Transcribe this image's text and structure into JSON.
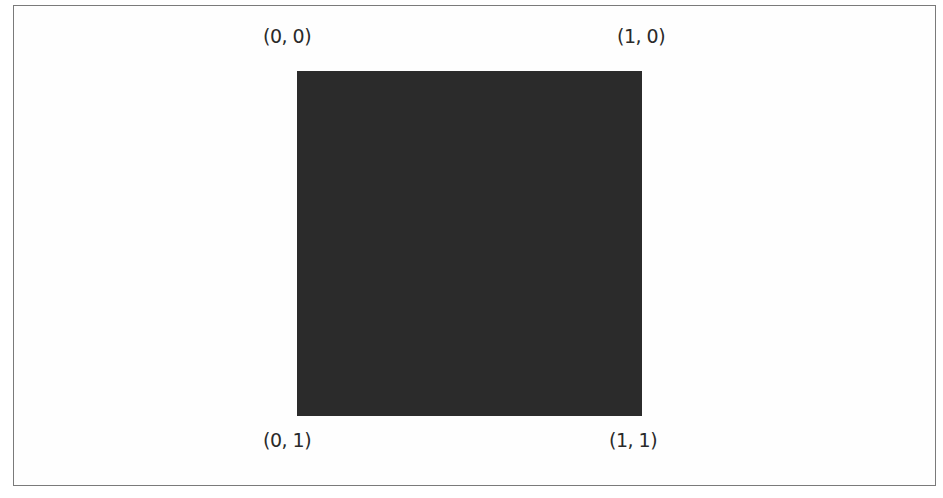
{
  "diagram": {
    "shape": "square",
    "fill_color": "#2b2b2b",
    "corners": {
      "top_left": "(0, 0)",
      "top_right": "(1, 0)",
      "bottom_left": "(0, 1)",
      "bottom_right": "(1, 1)"
    }
  }
}
